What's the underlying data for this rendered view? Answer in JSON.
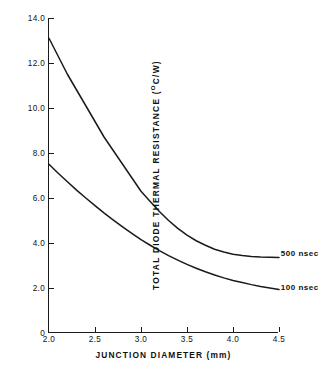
{
  "chart_data": {
    "type": "line",
    "title": "",
    "xlabel": "JUNCTION DIAMETER (mm)",
    "ylabel": "TOTAL DIODE THERMAL RESISTANCE (°C/W)",
    "ylabel_main": "TOTAL DIODE THERMAL RESISTANCE  (",
    "ylabel_unit_sup": "O",
    "ylabel_unit_rest": "C/W)",
    "xlim": [
      2.0,
      4.5
    ],
    "ylim": [
      0,
      14.0
    ],
    "grid": false,
    "legend_position": "inline-right-of-curve",
    "xticks": [
      "2.0",
      "2.5",
      "3.0",
      "3.5",
      "4.0",
      "4.5"
    ],
    "xtick_values": [
      2.0,
      2.5,
      3.0,
      3.5,
      4.0,
      4.5
    ],
    "yticks": [
      "0",
      "2.0",
      "4.0",
      "6.0",
      "8.0",
      "10.0",
      "12.0",
      "14.0"
    ],
    "ytick_values": [
      0,
      2.0,
      4.0,
      6.0,
      8.0,
      10.0,
      12.0,
      14.0
    ],
    "x": [
      2.0,
      2.1,
      2.2,
      2.3,
      2.4,
      2.5,
      2.6,
      2.7,
      2.8,
      2.9,
      3.0,
      3.1,
      3.2,
      3.3,
      3.4,
      3.5,
      3.6,
      3.7,
      3.8,
      3.9,
      4.0,
      4.1,
      4.2,
      4.3,
      4.4,
      4.5
    ],
    "series": [
      {
        "name": "500 nsec",
        "label": "500 nsec",
        "color": "#1a1a1a",
        "values": [
          13.1,
          12.3,
          11.5,
          10.8,
          10.1,
          9.4,
          8.7,
          8.1,
          7.5,
          6.9,
          6.3,
          5.85,
          5.4,
          5.0,
          4.65,
          4.35,
          4.1,
          3.9,
          3.72,
          3.6,
          3.5,
          3.44,
          3.4,
          3.38,
          3.37,
          3.36
        ]
      },
      {
        "name": "100 nsec",
        "label": "100 nsec",
        "color": "#1a1a1a",
        "values": [
          7.5,
          7.1,
          6.72,
          6.35,
          6.0,
          5.66,
          5.33,
          5.02,
          4.72,
          4.43,
          4.15,
          3.9,
          3.66,
          3.44,
          3.24,
          3.05,
          2.88,
          2.72,
          2.58,
          2.45,
          2.33,
          2.24,
          2.15,
          2.07,
          2.0,
          1.93
        ]
      }
    ],
    "annotations": [
      {
        "text": "500 nsec",
        "x": 4.52,
        "y": 3.55
      },
      {
        "text": "100 nsec",
        "x": 4.52,
        "y": 2.05
      }
    ]
  }
}
